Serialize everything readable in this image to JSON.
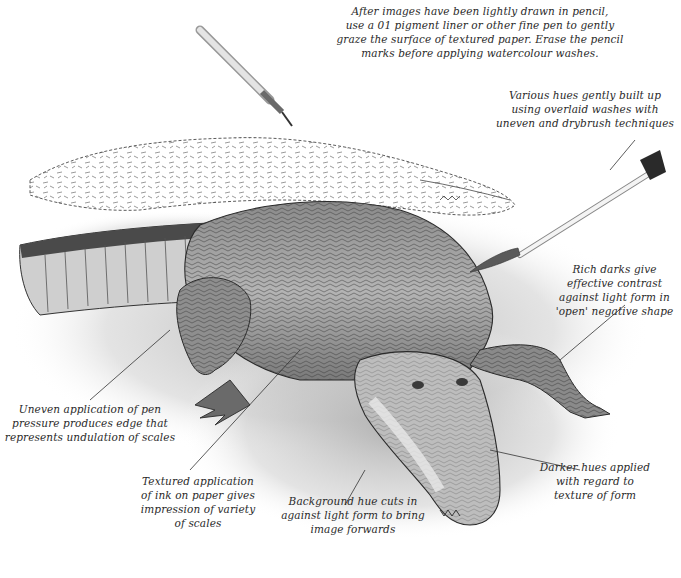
{
  "illustration": {
    "subject": "crocodile pen-and-wash drawing",
    "tools": [
      "pigment-liner-pen",
      "watercolour-brush"
    ],
    "colors": {
      "ink": "#2a2a2a",
      "wash_dark": "#5a5a5a",
      "wash_mid": "#9a9a9a",
      "wash_light": "#d6d6d6",
      "paper": "#ffffff"
    }
  },
  "annotations": {
    "pen_note": {
      "lines": [
        "After images have been lightly drawn in pencil,",
        "use a 01 pigment liner or other fine pen to gently",
        "graze the surface of textured paper. Erase the pencil",
        "marks before applying watercolour washes."
      ]
    },
    "brush_note": {
      "lines": [
        "Various hues gently built up",
        "using overlaid washes with",
        "uneven and drybrush techniques"
      ]
    },
    "darks_note": {
      "lines": [
        "Rich darks give",
        "effective contrast",
        "against light form in",
        "'open' negative shape"
      ]
    },
    "edge_note": {
      "lines": [
        "Uneven application of pen",
        "pressure produces edge that",
        "represents undulation of scales"
      ]
    },
    "texture_note": {
      "lines": [
        "Textured application",
        "of ink on paper gives",
        "impression of variety",
        "of scales"
      ]
    },
    "background_note": {
      "lines": [
        "Background hue cuts in",
        "against light form to bring",
        "image forwards"
      ]
    },
    "darker_hues_note": {
      "lines": [
        "Darker hues applied",
        "with regard to",
        "texture of form"
      ]
    }
  }
}
